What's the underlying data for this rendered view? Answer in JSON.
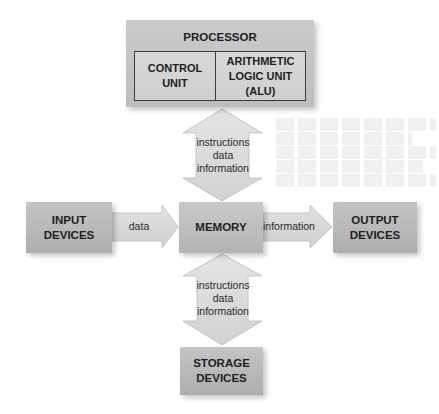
{
  "diagram": {
    "processor": {
      "title": "PROCESSOR",
      "control_unit": [
        "CONTROL",
        "UNIT"
      ],
      "alu": [
        "ARITHMETIC",
        "LOGIC UNIT (ALU)"
      ]
    },
    "boxes": {
      "input": [
        "INPUT",
        "DEVICES"
      ],
      "memory": "MEMORY",
      "output": [
        "OUTPUT",
        "DEVICES"
      ],
      "storage": [
        "STORAGE",
        "DEVICES"
      ]
    },
    "arrows": {
      "processor_memory": [
        "instructions",
        "data",
        "information"
      ],
      "memory_storage": [
        "instructions",
        "data",
        "information"
      ],
      "input_memory": "data",
      "memory_output": "information"
    },
    "colors": {
      "box_fill": "#bdbdbd",
      "arrow_fill": "#dcdcdc",
      "arrow_stroke": "#c8c8c8",
      "text": "#1e1e1e"
    }
  }
}
